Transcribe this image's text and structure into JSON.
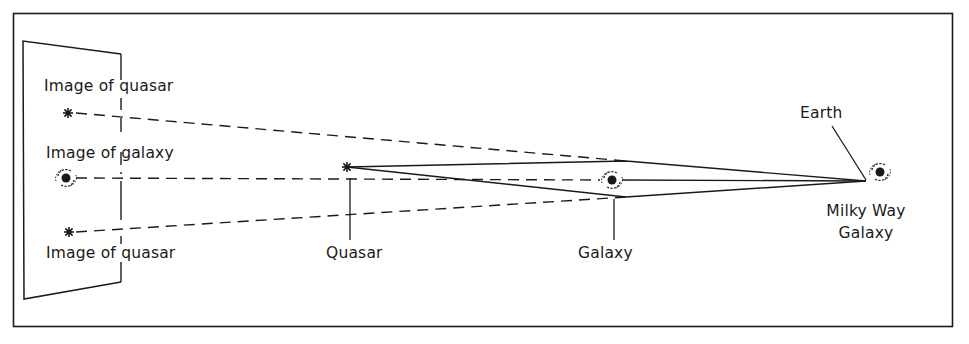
{
  "figure": {
    "colors": {
      "ink": "#1a1a1a",
      "background": "#ffffff"
    }
  },
  "labels": {
    "image_of_quasar_top": "Image of quasar",
    "image_of_galaxy": "Image of galaxy",
    "image_of_quasar_bottom": "Image of quasar",
    "quasar": "Quasar",
    "galaxy": "Galaxy",
    "earth": "Earth",
    "milky_way_line1": "Milky Way",
    "milky_way_line2": "Galaxy"
  },
  "objects": [
    {
      "id": "quasar",
      "icon": "star-icon"
    },
    {
      "id": "lensing-galaxy",
      "icon": "spiral-galaxy-icon"
    },
    {
      "id": "milky-way",
      "icon": "spiral-galaxy-icon"
    },
    {
      "id": "image-quasar-top",
      "icon": "star-icon"
    },
    {
      "id": "image-galaxy",
      "icon": "spiral-galaxy-icon"
    },
    {
      "id": "image-quasar-bottom",
      "icon": "star-icon"
    }
  ]
}
